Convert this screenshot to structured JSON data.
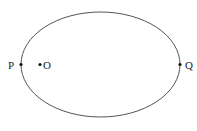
{
  "diagram": {
    "type": "ellipse-with-points",
    "ellipse": {
      "cx": 100.5,
      "cy": 64.5,
      "rx": 79.5,
      "ry": 52.5,
      "stroke": "#555555"
    },
    "points": [
      {
        "label": "P",
        "x": 21,
        "y": 64.5,
        "label_x": 8,
        "label_y": 68.5
      },
      {
        "label": "O",
        "x": 40,
        "y": 64.5,
        "label_x": 43,
        "label_y": 68.5
      },
      {
        "label": "Q",
        "x": 180,
        "y": 64.5,
        "label_x": 185,
        "label_y": 68.5
      }
    ]
  }
}
